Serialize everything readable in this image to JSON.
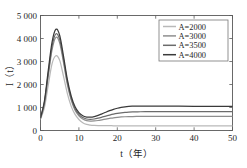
{
  "chart_data": {
    "type": "line",
    "title": "",
    "xlabel": "t（年）",
    "ylabel": "I（t）",
    "xlim": [
      0,
      50
    ],
    "ylim": [
      0,
      5000
    ],
    "grid": false,
    "legend_position": "top-right",
    "x_ticks": [
      0,
      10,
      20,
      30,
      40,
      50
    ],
    "x_tick_labels": [
      "0",
      "10",
      "20",
      "30",
      "40",
      "50"
    ],
    "y_ticks": [
      0,
      1000,
      2000,
      3000,
      4000,
      5000
    ],
    "y_tick_labels": [
      "0",
      "1 000",
      "2 000",
      "3 000",
      "4 000",
      "5 000"
    ],
    "x": [
      0,
      1,
      2,
      3,
      4,
      5,
      6,
      7,
      8,
      9,
      10,
      11,
      12,
      13,
      14,
      15,
      16,
      17,
      18,
      19,
      20,
      21,
      22,
      23,
      24,
      25,
      26,
      28,
      30,
      33,
      36,
      40,
      45,
      50
    ],
    "series": [
      {
        "name": "A=2000",
        "color": "#b9b9b9",
        "values": [
          500,
          980,
          1950,
          2900,
          3250,
          3050,
          2350,
          1600,
          1050,
          700,
          480,
          340,
          265,
          235,
          222,
          215,
          212,
          210,
          208,
          206,
          205,
          204,
          203,
          202,
          202,
          202,
          201,
          201,
          200,
          200,
          200,
          200,
          200,
          200
        ]
      },
      {
        "name": "A=3000",
        "color": "#8e8e8e",
        "values": [
          520,
          1150,
          2350,
          3500,
          4050,
          3800,
          2950,
          2000,
          1320,
          880,
          640,
          500,
          430,
          410,
          415,
          435,
          465,
          495,
          525,
          552,
          572,
          588,
          598,
          605,
          608,
          610,
          611,
          612,
          612,
          612,
          612,
          612,
          612,
          612
        ]
      },
      {
        "name": "A=3500",
        "color": "#6b6b6b",
        "values": [
          540,
          1200,
          2450,
          3650,
          4200,
          3950,
          3080,
          2100,
          1400,
          950,
          700,
          562,
          500,
          486,
          500,
          535,
          580,
          628,
          672,
          712,
          745,
          770,
          788,
          800,
          808,
          812,
          815,
          818,
          820,
          820,
          820,
          820,
          820,
          820
        ]
      },
      {
        "name": "A=4000",
        "color": "#3a3a3a",
        "values": [
          560,
          1260,
          2580,
          3830,
          4400,
          4130,
          3220,
          2210,
          1490,
          1030,
          775,
          640,
          585,
          580,
          608,
          660,
          725,
          795,
          862,
          920,
          968,
          1005,
          1032,
          1048,
          1056,
          1060,
          1062,
          1062,
          1060,
          1058,
          1055,
          1052,
          1048,
          1045
        ]
      }
    ]
  },
  "legend": {
    "items": [
      {
        "label": "A=2000"
      },
      {
        "label": "A=3000"
      },
      {
        "label": "A=3500"
      },
      {
        "label": "A=4000"
      }
    ]
  }
}
